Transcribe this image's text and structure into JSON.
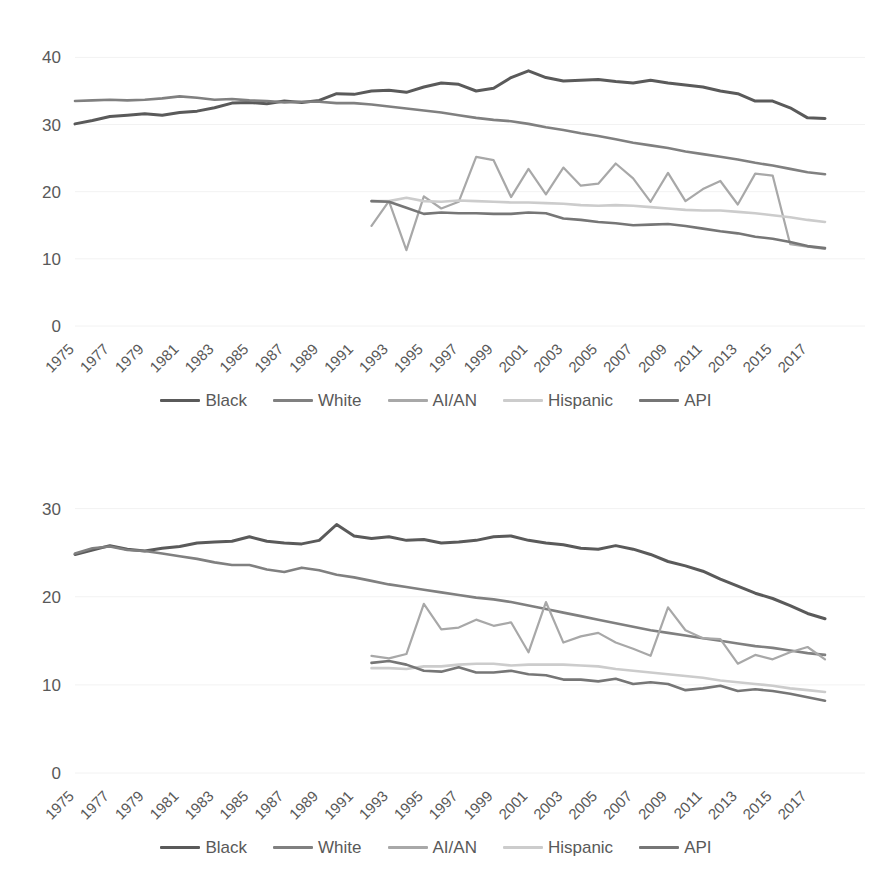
{
  "figure": {
    "background": "#ffffff",
    "charts": [
      {
        "id": "top",
        "chart_data": {
          "type": "line",
          "title": "",
          "subtitle": "",
          "xlabel": "",
          "ylabel": "",
          "xlim": [
            1975,
            2018
          ],
          "ylim": [
            0,
            42
          ],
          "yticks": [
            0,
            10,
            20,
            30,
            40
          ],
          "ytick_labels": [
            "0",
            "10",
            "20",
            "30",
            "40"
          ],
          "grid": true,
          "grid_axis": "y",
          "legend_position": "bottom",
          "x": [
            1975,
            1976,
            1977,
            1978,
            1979,
            1980,
            1981,
            1982,
            1983,
            1984,
            1985,
            1986,
            1987,
            1988,
            1989,
            1990,
            1991,
            1992,
            1993,
            1994,
            1995,
            1996,
            1997,
            1998,
            1999,
            2000,
            2001,
            2002,
            2003,
            2004,
            2005,
            2006,
            2007,
            2008,
            2009,
            2010,
            2011,
            2012,
            2013,
            2014,
            2015,
            2016,
            2017,
            2018
          ],
          "xtick_labels": [
            "1975",
            "1977",
            "1979",
            "1981",
            "1983",
            "1985",
            "1987",
            "1989",
            "1991",
            "1993",
            "1995",
            "1997",
            "1999",
            "2001",
            "2003",
            "2005",
            "2007",
            "2009",
            "2011",
            "2013",
            "2015",
            "2017"
          ],
          "series": [
            {
              "name": "Black",
              "color": "#5a5a5a",
              "width": 3,
              "start_year": 1975,
              "values": [
                30.1,
                30.6,
                31.2,
                31.4,
                31.6,
                31.4,
                31.8,
                32.0,
                32.5,
                33.2,
                33.3,
                33.1,
                33.5,
                33.3,
                33.6,
                34.6,
                34.5,
                35.0,
                35.1,
                34.8,
                35.6,
                36.2,
                36.0,
                35.0,
                35.4,
                37.0,
                38.0,
                37.0,
                36.5,
                36.6,
                36.7,
                36.4,
                36.2,
                36.6,
                36.2,
                35.9,
                35.6,
                35.0,
                34.6,
                33.5,
                33.5,
                32.5,
                31.0,
                30.9
              ]
            },
            {
              "name": "White",
              "color": "#808080",
              "width": 2.6,
              "start_year": 1975,
              "values": [
                33.5,
                33.6,
                33.7,
                33.6,
                33.7,
                33.9,
                34.2,
                34.0,
                33.7,
                33.8,
                33.6,
                33.5,
                33.3,
                33.4,
                33.4,
                33.2,
                33.2,
                33.0,
                32.7,
                32.4,
                32.1,
                31.8,
                31.4,
                31.0,
                30.7,
                30.5,
                30.1,
                29.6,
                29.2,
                28.7,
                28.3,
                27.8,
                27.3,
                26.9,
                26.5,
                26.0,
                25.6,
                25.2,
                24.8,
                24.3,
                23.9,
                23.4,
                22.9,
                22.6
              ]
            },
            {
              "name": "AI/AN",
              "color": "#a8a8a8",
              "width": 2.2,
              "start_year": 1992,
              "values": [
                14.9,
                18.6,
                11.3,
                19.3,
                17.5,
                18.5,
                25.2,
                24.7,
                19.2,
                23.4,
                19.6,
                23.6,
                20.9,
                21.2,
                24.2,
                22.0,
                18.5,
                22.8,
                18.6,
                20.4,
                21.6,
                18.1,
                22.7,
                22.4,
                12.2,
                11.8,
                11.5
              ]
            },
            {
              "name": "Hispanic",
              "color": "#cccccc",
              "width": 2.6,
              "start_year": 1992,
              "values": [
                18.6,
                18.6,
                19.1,
                18.6,
                18.5,
                18.7,
                18.6,
                18.5,
                18.4,
                18.4,
                18.3,
                18.2,
                18.0,
                17.9,
                18.0,
                17.9,
                17.7,
                17.5,
                17.3,
                17.2,
                17.2,
                17.0,
                16.8,
                16.5,
                16.2,
                15.8,
                15.5
              ]
            },
            {
              "name": "API",
              "color": "#767676",
              "width": 2.6,
              "start_year": 1992,
              "values": [
                18.6,
                18.5,
                17.6,
                16.7,
                16.9,
                16.8,
                16.8,
                16.7,
                16.7,
                16.9,
                16.8,
                16.0,
                15.8,
                15.5,
                15.3,
                15.0,
                15.1,
                15.2,
                14.9,
                14.5,
                14.1,
                13.8,
                13.3,
                13.0,
                12.5,
                11.9,
                11.6
              ]
            }
          ]
        }
      },
      {
        "id": "bottom",
        "chart_data": {
          "type": "line",
          "title": "",
          "subtitle": "",
          "xlabel": "",
          "ylabel": "",
          "xlim": [
            1975,
            2018
          ],
          "ylim": [
            0,
            32
          ],
          "yticks": [
            0,
            10,
            20,
            30
          ],
          "ytick_labels": [
            "0",
            "10",
            "20",
            "30"
          ],
          "grid": true,
          "grid_axis": "y",
          "legend_position": "bottom",
          "x": [
            1975,
            1976,
            1977,
            1978,
            1979,
            1980,
            1981,
            1982,
            1983,
            1984,
            1985,
            1986,
            1987,
            1988,
            1989,
            1990,
            1991,
            1992,
            1993,
            1994,
            1995,
            1996,
            1997,
            1998,
            1999,
            2000,
            2001,
            2002,
            2003,
            2004,
            2005,
            2006,
            2007,
            2008,
            2009,
            2010,
            2011,
            2012,
            2013,
            2014,
            2015,
            2016,
            2017,
            2018
          ],
          "xtick_labels": [
            "1975",
            "1977",
            "1979",
            "1981",
            "1983",
            "1985",
            "1987",
            "1989",
            "1991",
            "1993",
            "1995",
            "1997",
            "1999",
            "2001",
            "2003",
            "2005",
            "2007",
            "2009",
            "2011",
            "2013",
            "2015",
            "2017"
          ],
          "series": [
            {
              "name": "Black",
              "color": "#5a5a5a",
              "width": 3,
              "start_year": 1975,
              "values": [
                24.8,
                25.3,
                25.8,
                25.4,
                25.2,
                25.5,
                25.7,
                26.1,
                26.2,
                26.3,
                26.8,
                26.3,
                26.1,
                26.0,
                26.4,
                28.2,
                26.9,
                26.6,
                26.8,
                26.4,
                26.5,
                26.1,
                26.2,
                26.4,
                26.8,
                26.9,
                26.4,
                26.1,
                25.9,
                25.5,
                25.4,
                25.8,
                25.4,
                24.8,
                24.0,
                23.5,
                22.9,
                22.0,
                21.2,
                20.4,
                19.8,
                19.0,
                18.1,
                17.5
              ]
            },
            {
              "name": "White",
              "color": "#808080",
              "width": 2.6,
              "start_year": 1975,
              "values": [
                24.9,
                25.5,
                25.7,
                25.3,
                25.2,
                24.9,
                24.6,
                24.3,
                23.9,
                23.6,
                23.6,
                23.1,
                22.8,
                23.3,
                23.0,
                22.5,
                22.2,
                21.8,
                21.4,
                21.1,
                20.8,
                20.5,
                20.2,
                19.9,
                19.7,
                19.4,
                19.0,
                18.6,
                18.2,
                17.8,
                17.4,
                17.0,
                16.6,
                16.2,
                15.9,
                15.6,
                15.3,
                15.0,
                14.7,
                14.4,
                14.2,
                13.9,
                13.6,
                13.4
              ]
            },
            {
              "name": "AI/AN",
              "color": "#a8a8a8",
              "width": 2.2,
              "start_year": 1992,
              "values": [
                13.3,
                13.0,
                13.5,
                19.2,
                16.3,
                16.5,
                17.4,
                16.7,
                17.1,
                13.7,
                19.4,
                14.8,
                15.5,
                15.9,
                14.8,
                14.1,
                13.3,
                18.8,
                16.2,
                15.3,
                15.2,
                12.4,
                13.4,
                12.9,
                13.7,
                14.3,
                12.9
              ]
            },
            {
              "name": "Hispanic",
              "color": "#cccccc",
              "width": 2.6,
              "start_year": 1992,
              "values": [
                11.9,
                11.9,
                11.8,
                12.1,
                12.1,
                12.3,
                12.4,
                12.4,
                12.2,
                12.3,
                12.3,
                12.3,
                12.2,
                12.1,
                11.8,
                11.6,
                11.4,
                11.2,
                11.0,
                10.8,
                10.5,
                10.3,
                10.1,
                9.9,
                9.6,
                9.4,
                9.2
              ]
            },
            {
              "name": "API",
              "color": "#767676",
              "width": 2.6,
              "start_year": 1992,
              "values": [
                12.5,
                12.7,
                12.3,
                11.6,
                11.5,
                12.0,
                11.4,
                11.4,
                11.6,
                11.2,
                11.1,
                10.6,
                10.6,
                10.4,
                10.7,
                10.1,
                10.3,
                10.1,
                9.4,
                9.6,
                9.9,
                9.3,
                9.5,
                9.3,
                9.0,
                8.6,
                8.2
              ]
            }
          ]
        }
      }
    ],
    "legend": [
      {
        "label": "Black",
        "color": "#5a5a5a",
        "swatch": "line-swatch"
      },
      {
        "label": "White",
        "color": "#808080",
        "swatch": "line-swatch"
      },
      {
        "label": "AI/AN",
        "color": "#a8a8a8",
        "swatch": "line-swatch"
      },
      {
        "label": "Hispanic",
        "color": "#cccccc",
        "swatch": "line-swatch"
      },
      {
        "label": "API",
        "color": "#767676",
        "swatch": "line-swatch"
      }
    ]
  }
}
